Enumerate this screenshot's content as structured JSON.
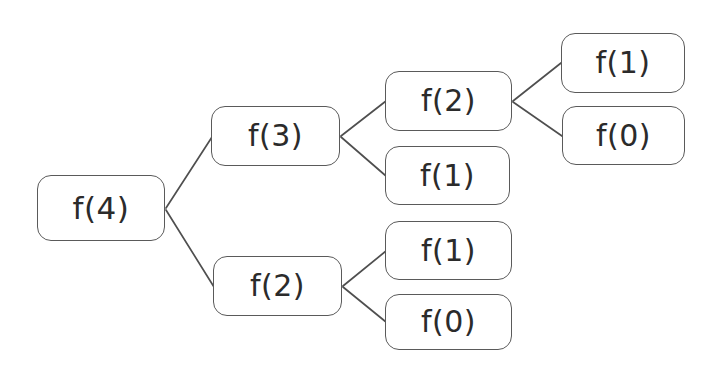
{
  "diagram": {
    "type": "recursion-tree",
    "background_color": "#ffffff",
    "node_border_color": "#5a5a5a",
    "node_fill_color": "#ffffff",
    "text_color": "#2b2b2b",
    "edge_color": "#4f4f4f",
    "nodes": [
      {
        "id": "n0",
        "label": "f(4)",
        "x": 37,
        "y": 175,
        "w": 128,
        "h": 66,
        "font_size": 31
      },
      {
        "id": "n1",
        "label": "f(3)",
        "x": 211,
        "y": 106,
        "w": 129,
        "h": 60,
        "font_size": 30
      },
      {
        "id": "n2",
        "label": "f(2)",
        "x": 385,
        "y": 71,
        "w": 127,
        "h": 60,
        "font_size": 30
      },
      {
        "id": "n3",
        "label": "f(1)",
        "x": 561,
        "y": 33,
        "w": 124,
        "h": 60,
        "font_size": 30
      },
      {
        "id": "n4",
        "label": "f(0)",
        "x": 562,
        "y": 106,
        "w": 123,
        "h": 59,
        "font_size": 30
      },
      {
        "id": "n5",
        "label": "f(1)",
        "x": 385,
        "y": 146,
        "w": 125,
        "h": 59,
        "font_size": 30
      },
      {
        "id": "n6",
        "label": "f(2)",
        "x": 213,
        "y": 256,
        "w": 129,
        "h": 60,
        "font_size": 30
      },
      {
        "id": "n7",
        "label": "f(1)",
        "x": 385,
        "y": 221,
        "w": 127,
        "h": 59,
        "font_size": 30
      },
      {
        "id": "n8",
        "label": "f(0)",
        "x": 385,
        "y": 294,
        "w": 127,
        "h": 56,
        "font_size": 30
      }
    ],
    "edges": [
      {
        "id": "e0",
        "from": "n0",
        "to": "n1",
        "x1": 166,
        "y1": 208,
        "x2": 212,
        "y2": 137
      },
      {
        "id": "e1",
        "from": "n0",
        "to": "n6",
        "x1": 166,
        "y1": 210,
        "x2": 214,
        "y2": 287
      },
      {
        "id": "e2",
        "from": "n1",
        "to": "n2",
        "x1": 341,
        "y1": 136,
        "x2": 386,
        "y2": 101
      },
      {
        "id": "e3",
        "from": "n1",
        "to": "n5",
        "x1": 341,
        "y1": 137,
        "x2": 386,
        "y2": 176
      },
      {
        "id": "e4",
        "from": "n2",
        "to": "n3",
        "x1": 513,
        "y1": 101,
        "x2": 561,
        "y2": 63
      },
      {
        "id": "e5",
        "from": "n2",
        "to": "n4",
        "x1": 513,
        "y1": 102,
        "x2": 562,
        "y2": 136
      },
      {
        "id": "e6",
        "from": "n6",
        "to": "n7",
        "x1": 343,
        "y1": 286,
        "x2": 386,
        "y2": 251
      },
      {
        "id": "e7",
        "from": "n6",
        "to": "n8",
        "x1": 343,
        "y1": 287,
        "x2": 386,
        "y2": 322
      }
    ]
  }
}
